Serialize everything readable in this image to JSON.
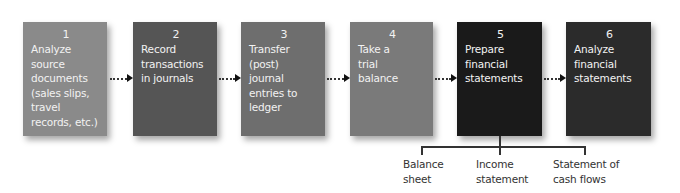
{
  "diagram": {
    "steps": [
      {
        "number": "1",
        "text": "Analyze\nsource\ndocuments\n(sales slips,\ntravel\nrecords, etc.)",
        "color": "#8a8a8a"
      },
      {
        "number": "2",
        "text": "Record\ntransactions\nin journals",
        "color": "#555555"
      },
      {
        "number": "3",
        "text": "Transfer\n(post)\njournal\nentries to\nledger",
        "color": "#6e6e6e"
      },
      {
        "number": "4",
        "text": "Take a\ntrial\nbalance",
        "color": "#7a7a7a"
      },
      {
        "number": "5",
        "text": "Prepare\nfinancial\nstatements",
        "color": "#1a1a1a"
      },
      {
        "number": "6",
        "text": "Analyze\nfinancial\nstatements",
        "color": "#2b2b2b"
      }
    ],
    "connector_style": "dotted-arrow",
    "statements": [
      {
        "text": "Balance\nsheet"
      },
      {
        "text": "Income\nstatement"
      },
      {
        "text": "Statement of\ncash flows"
      }
    ]
  }
}
